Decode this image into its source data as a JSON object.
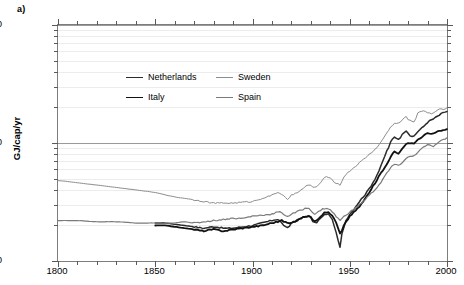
{
  "panel": {
    "label": "a)"
  },
  "axes": {
    "ylabel": "GJ/cap/yr",
    "xlabel": "",
    "yticks": [
      "10",
      "100",
      "1000"
    ],
    "xticks": [
      "1800",
      "1850",
      "1900",
      "1950",
      "2000"
    ]
  },
  "legend": {
    "items": [
      {
        "label": "Netherlands",
        "color": "#2b2b2b",
        "width": 1.5
      },
      {
        "label": "Sweden",
        "color": "#8c8c8c",
        "width": 1.0
      },
      {
        "label": "Italy",
        "color": "#111111",
        "width": 1.8
      },
      {
        "label": "Spain",
        "color": "#7a7a7a",
        "width": 1.2
      }
    ]
  },
  "chart_data": {
    "type": "line",
    "title": "",
    "xlabel": "",
    "ylabel": "GJ/cap/yr",
    "yscale": "log",
    "xlim": [
      1800,
      2000
    ],
    "ylim": [
      10,
      1000
    ],
    "grid": true,
    "legend_position": "upper-left-inside",
    "series": [
      {
        "name": "Netherlands",
        "color": "#2b2b2b",
        "x": [
          1850,
          1855,
          1860,
          1865,
          1870,
          1875,
          1880,
          1885,
          1890,
          1895,
          1900,
          1905,
          1910,
          1913,
          1915,
          1918,
          1920,
          1925,
          1929,
          1932,
          1935,
          1938,
          1940,
          1942,
          1944,
          1945,
          1946,
          1948,
          1950,
          1955,
          1960,
          1965,
          1970,
          1973,
          1975,
          1979,
          1980,
          1982,
          1985,
          1988,
          1990,
          1993,
          1995,
          1998,
          2000
        ],
        "y": [
          21,
          21,
          20.5,
          20,
          19.5,
          19,
          19.5,
          19,
          19,
          19.5,
          20,
          21,
          22,
          22.5,
          21,
          19,
          21,
          23,
          24,
          21,
          23,
          25,
          24,
          20,
          15,
          13,
          17,
          22,
          25,
          32,
          41,
          58,
          92,
          112,
          108,
          128,
          122,
          112,
          125,
          138,
          150,
          160,
          168,
          180,
          185
        ]
      },
      {
        "name": "Sweden",
        "color": "#8c8c8c",
        "x": [
          1800,
          1810,
          1820,
          1830,
          1840,
          1850,
          1860,
          1865,
          1870,
          1875,
          1880,
          1885,
          1890,
          1895,
          1900,
          1905,
          1910,
          1913,
          1916,
          1918,
          1920,
          1925,
          1929,
          1932,
          1935,
          1938,
          1940,
          1942,
          1944,
          1945,
          1947,
          1950,
          1955,
          1960,
          1965,
          1970,
          1973,
          1976,
          1979,
          1980,
          1983,
          1985,
          1988,
          1990,
          1993,
          1996,
          1998,
          2000
        ],
        "y": [
          48,
          46,
          44,
          42,
          40,
          38,
          35,
          34,
          33,
          32,
          31,
          31,
          31,
          31.5,
          32,
          34,
          36,
          38,
          36,
          33,
          36,
          40,
          44,
          42,
          46,
          52,
          50,
          47,
          45,
          44,
          52,
          58,
          68,
          80,
          96,
          128,
          146,
          150,
          168,
          158,
          152,
          178,
          188,
          182,
          178,
          196,
          192,
          200
        ]
      },
      {
        "name": "Italy",
        "color": "#111111",
        "x": [
          1850,
          1855,
          1860,
          1865,
          1870,
          1875,
          1880,
          1885,
          1890,
          1895,
          1900,
          1905,
          1910,
          1913,
          1915,
          1918,
          1920,
          1925,
          1929,
          1932,
          1935,
          1938,
          1940,
          1942,
          1944,
          1945,
          1947,
          1950,
          1955,
          1960,
          1965,
          1970,
          1973,
          1975,
          1979,
          1980,
          1983,
          1985,
          1988,
          1990,
          1993,
          1996,
          1998,
          2000
        ],
        "y": [
          20,
          20,
          19.5,
          19,
          18.5,
          18,
          18.5,
          18,
          18.5,
          19,
          19.5,
          20,
          21,
          21.5,
          22,
          21,
          21,
          23,
          24,
          22,
          24,
          26,
          25,
          23,
          19,
          17,
          20,
          24,
          29,
          38,
          52,
          70,
          85,
          82,
          97,
          100,
          100,
          106,
          116,
          120,
          120,
          126,
          128,
          130
        ]
      },
      {
        "name": "Spain",
        "color": "#7a7a7a",
        "x": [
          1800,
          1810,
          1820,
          1830,
          1840,
          1850,
          1860,
          1865,
          1870,
          1875,
          1880,
          1885,
          1890,
          1895,
          1900,
          1905,
          1910,
          1913,
          1915,
          1918,
          1920,
          1925,
          1929,
          1932,
          1935,
          1938,
          1940,
          1942,
          1944,
          1945,
          1947,
          1950,
          1955,
          1960,
          1965,
          1970,
          1973,
          1975,
          1979,
          1980,
          1983,
          1985,
          1988,
          1990,
          1993,
          1996,
          1998,
          2000
        ],
        "y": [
          22,
          22,
          21.5,
          21.5,
          21,
          21,
          21,
          21.5,
          21,
          21.5,
          22,
          22.5,
          23,
          23,
          24,
          24.5,
          25,
          26,
          25.5,
          24,
          25,
          27,
          28,
          25,
          27,
          28,
          27,
          25,
          23,
          22,
          24,
          26,
          30,
          36,
          44,
          58,
          66,
          64,
          74,
          76,
          78,
          84,
          92,
          96,
          94,
          102,
          106,
          110
        ]
      }
    ]
  }
}
